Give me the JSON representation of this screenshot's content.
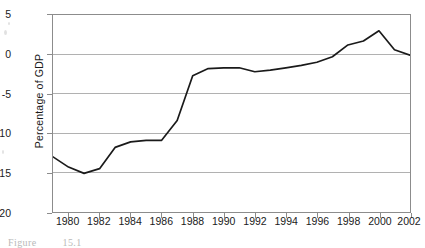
{
  "figure": {
    "caption_label": "Figure",
    "caption_number": "15.1"
  },
  "axes": {
    "ylabel": "Percentage of GDP",
    "xlabel": "",
    "yticks": [
      "5",
      "0",
      "-5",
      "-10",
      "-15",
      "-20"
    ],
    "xticks": [
      "1980",
      "1982",
      "1984",
      "1986",
      "1988",
      "1990",
      "1992",
      "1994",
      "1996",
      "1998",
      "2000",
      "2002"
    ]
  },
  "style": {
    "line_color": "#1a1a1a",
    "grid_color": "#b0b0b0",
    "frame_color": "#8c8c8c",
    "background": "#ffffff",
    "text_color": "#1a1a1a"
  },
  "chart_data": {
    "type": "line",
    "title": "",
    "xlabel": "",
    "ylabel": "Percentage of GDP",
    "xlim": [
      1979,
      2002
    ],
    "ylim": [
      -20,
      5
    ],
    "yticks": [
      5,
      0,
      -5,
      -10,
      -15,
      -20
    ],
    "xticks": [
      1980,
      1982,
      1984,
      1986,
      1988,
      1990,
      1992,
      1994,
      1996,
      1998,
      2000,
      2002
    ],
    "grid": "horizontal",
    "legend": "none",
    "x": [
      1979,
      1980,
      1981,
      1982,
      1983,
      1984,
      1985,
      1986,
      1987,
      1988,
      1989,
      1990,
      1991,
      1992,
      1993,
      1994,
      1995,
      1996,
      1997,
      1998,
      1999,
      2000,
      2001,
      2002
    ],
    "series": [
      {
        "name": "Percentage of GDP",
        "values": [
          -13.0,
          -14.3,
          -15.1,
          -14.5,
          -11.8,
          -11.1,
          -10.9,
          -10.9,
          -8.4,
          -2.7,
          -1.8,
          -1.7,
          -1.7,
          -2.2,
          -2.0,
          -1.7,
          -1.4,
          -1.0,
          -0.3,
          1.2,
          1.7,
          3.0,
          0.6,
          -0.1
        ]
      }
    ]
  }
}
